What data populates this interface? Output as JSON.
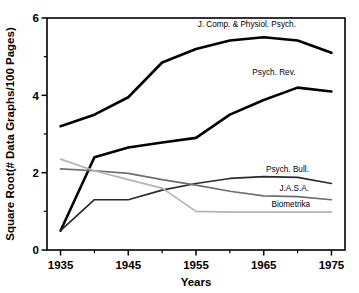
{
  "chart_data": {
    "type": "line",
    "title": "",
    "xlabel": "Years",
    "ylabel": "Square Root(# Data Graphs/100 Pages)",
    "xlim": [
      1933,
      1977
    ],
    "ylim": [
      0,
      6
    ],
    "xticks": [
      1935,
      1945,
      1955,
      1965,
      1975
    ],
    "xtick_labels": [
      "1935",
      "1945",
      "1955",
      "1965",
      "1975"
    ],
    "xminor_ticks": [
      1940,
      1950,
      1960,
      1970
    ],
    "yticks": [
      0,
      2,
      4,
      6
    ],
    "ytick_labels": [
      "0",
      "2",
      "4",
      "6"
    ],
    "yminor_ticks": [
      1,
      3,
      5
    ],
    "grid": false,
    "legend_position": "inline-right-of-series",
    "series": [
      {
        "name": "J. Comp. & Physiol. Psych.",
        "color": "#000000",
        "width": 2.6,
        "label_x": 1962.5,
        "label_y": 5.78,
        "label_anchor": "middle",
        "x": [
          1935,
          1940,
          1945,
          1950,
          1955,
          1960,
          1965,
          1970,
          1975
        ],
        "y": [
          3.2,
          3.5,
          3.95,
          4.85,
          5.2,
          5.42,
          5.5,
          5.42,
          5.1
        ]
      },
      {
        "name": "Psych. Rev.",
        "color": "#000000",
        "width": 2.6,
        "label_x": 1966.5,
        "label_y": 4.52,
        "label_anchor": "middle",
        "x": [
          1935,
          1940,
          1945,
          1950,
          1955,
          1960,
          1965,
          1970,
          1975
        ],
        "y": [
          0.5,
          2.4,
          2.65,
          2.78,
          2.9,
          3.5,
          3.88,
          4.2,
          4.1
        ]
      },
      {
        "name": "Psych. Bull.",
        "color": "#2b2b2b",
        "width": 1.7,
        "label_x": 1968.5,
        "label_y": 2.02,
        "label_anchor": "middle",
        "x": [
          1935,
          1940,
          1945,
          1950,
          1955,
          1960,
          1965,
          1970,
          1975
        ],
        "y": [
          0.5,
          1.3,
          1.3,
          1.55,
          1.72,
          1.85,
          1.9,
          1.88,
          1.72
        ]
      },
      {
        "name": "J.A.S.A.",
        "color": "#6e6e6e",
        "width": 1.7,
        "label_x": 1969.5,
        "label_y": 1.52,
        "label_anchor": "middle",
        "x": [
          1935,
          1940,
          1945,
          1950,
          1955,
          1960,
          1965,
          1970,
          1975
        ],
        "y": [
          2.1,
          2.05,
          1.98,
          1.82,
          1.68,
          1.52,
          1.4,
          1.38,
          1.3
        ]
      },
      {
        "name": "Biometrika",
        "color": "#b4b4b4",
        "width": 1.7,
        "label_x": 1969.0,
        "label_y": 1.12,
        "label_anchor": "middle",
        "x": [
          1935,
          1940,
          1945,
          1950,
          1955,
          1960,
          1965,
          1970,
          1975
        ],
        "y": [
          2.35,
          2.05,
          1.82,
          1.6,
          1.0,
          0.98,
          0.98,
          0.98,
          0.98
        ]
      }
    ]
  }
}
